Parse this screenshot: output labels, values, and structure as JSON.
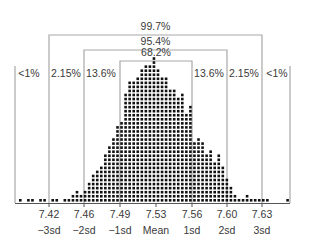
{
  "chart_data": {
    "type": "scatter",
    "subtype": "dot-histogram with standard deviation brackets",
    "title": "",
    "xlabel": "",
    "ylabel": "",
    "x_ticks": [
      {
        "value": "7.42",
        "label": "−3sd"
      },
      {
        "value": "7.46",
        "label": "−2sd"
      },
      {
        "value": "7.49",
        "label": "−1sd"
      },
      {
        "value": "7.53",
        "label": "Mean"
      },
      {
        "value": "7.56",
        "label": "1sd"
      },
      {
        "value": "7.60",
        "label": "2sd"
      },
      {
        "value": "7.63",
        "label": "3sd"
      }
    ],
    "brackets": [
      {
        "label": "99.7%",
        "from": "−3sd",
        "to": "3sd"
      },
      {
        "label": "95.4%",
        "from": "−2sd",
        "to": "2sd"
      },
      {
        "label": "68.2%",
        "from": "−1sd",
        "to": "1sd"
      }
    ],
    "region_labels": [
      "<1%",
      "2.15%",
      "13.6%",
      "13.6%",
      "2.15%",
      "<1%"
    ],
    "column_counts": [
      1,
      0,
      1,
      1,
      0,
      1,
      1,
      0,
      1,
      1,
      0,
      1,
      1,
      2,
      3,
      2,
      3,
      5,
      7,
      8,
      9,
      12,
      14,
      16,
      19,
      20,
      27,
      30,
      30,
      31,
      33,
      34,
      34,
      36,
      33,
      31,
      31,
      28,
      28,
      26,
      27,
      22,
      24,
      15,
      16,
      15,
      12,
      13,
      10,
      12,
      9,
      6,
      4,
      2,
      1,
      1,
      2,
      1,
      1,
      1,
      1,
      1,
      0,
      0,
      0,
      0,
      1
    ],
    "grid": false,
    "legend": null
  },
  "layout": {
    "colors": {
      "line": "#a8a8a8",
      "dot": "#111111",
      "axis": "#555555",
      "text": "#3a3a3a"
    }
  }
}
